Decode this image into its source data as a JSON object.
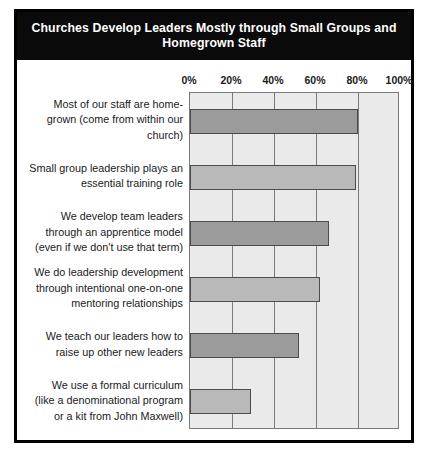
{
  "figure": {
    "title": "Churches Develop Leaders Mostly through Small Groups and Homegrown Staff"
  },
  "chart_data": {
    "type": "bar",
    "orientation": "horizontal",
    "title": "Churches Develop Leaders Mostly through Small Groups and Homegrown Staff",
    "xlabel": "",
    "ylabel": "",
    "xlim": [
      0,
      100
    ],
    "grid": true,
    "legend": "none",
    "tick_labels": [
      "0%",
      "20%",
      "40%",
      "60%",
      "80%",
      "100%"
    ],
    "ticks": [
      0,
      20,
      40,
      60,
      80,
      100
    ],
    "categories": [
      "Most of our staff are home-grown (come from within our church)",
      "Small group leadership plays an essential training role",
      "We develop team leaders through an apprentice model (even if we don't use that term)",
      "We do leadership development through intentional one-on-one mentoring relationships",
      "We teach our leaders how to raise up other new leaders",
      "We use a formal curriculum (like a denominational program or a kit from John Maxwell)"
    ],
    "category_lines": [
      [
        "Most of our staff are home-",
        "grown (come from within our",
        "church)"
      ],
      [
        "Small group leadership plays an",
        "essential training role"
      ],
      [
        "We develop team leaders",
        "through an apprentice model",
        "(even if we don't use that term)"
      ],
      [
        "We do leadership development",
        "through intentional one-on-one",
        "mentoring relationships"
      ],
      [
        "We teach our leaders how to",
        "raise up other new leaders"
      ],
      [
        "We use a formal curriculum",
        "(like a denominational program",
        "or a kit from John Maxwell)"
      ]
    ],
    "values": [
      80,
      79,
      66,
      62,
      52,
      29
    ],
    "bar_colors": [
      "#9b9b9b",
      "#b9b9b9",
      "#9b9b9b",
      "#b9b9b9",
      "#9b9b9b",
      "#b9b9b9"
    ],
    "bar_shades": [
      "dark",
      "light",
      "dark",
      "light",
      "dark",
      "light"
    ],
    "plot_background": "#eaeaea",
    "frame_color": "#000000",
    "title_background": "#0a0a0a",
    "title_color": "#ffffff"
  }
}
